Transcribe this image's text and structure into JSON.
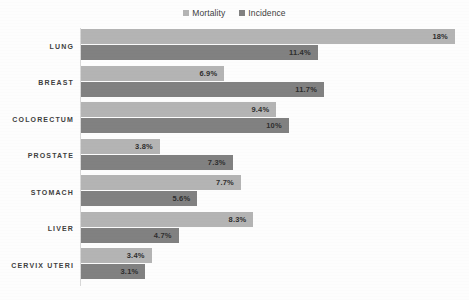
{
  "chart_data": {
    "type": "bar",
    "orientation": "horizontal",
    "grouped": true,
    "title": "",
    "subtitle": "",
    "xlabel": "",
    "ylabel": "",
    "grid": false,
    "legend_position": "top-center",
    "axis_tick_labels": [],
    "xlim": [
      0,
      18
    ],
    "categories": [
      "LUNG",
      "BREAST",
      "COLORECTUM",
      "PROSTATE",
      "STOMACH",
      "LIVER",
      "CERVIX UTERI"
    ],
    "series": [
      {
        "name": "Mortality",
        "color": "#b4b4b4",
        "values": [
          18,
          6.9,
          9.4,
          3.8,
          7.7,
          8.3,
          3.4
        ],
        "labels": [
          "18%",
          "6.9%",
          "9.4%",
          "3.8%",
          "7.7%",
          "8.3%",
          "3.4%"
        ]
      },
      {
        "name": "Incidence",
        "color": "#818181",
        "values": [
          11.4,
          11.7,
          10,
          7.3,
          5.6,
          4.7,
          3.1
        ],
        "labels": [
          "11.4%",
          "11.7%",
          "10%",
          "7.3%",
          "5.6%",
          "4.7%",
          "3.1%"
        ]
      }
    ]
  },
  "legend": {
    "items": [
      {
        "label": "Mortality",
        "color": "#b4b4b4",
        "icon": "square-swatch-icon"
      },
      {
        "label": "Incidence",
        "color": "#818181",
        "icon": "square-swatch-icon"
      }
    ]
  },
  "colors": {
    "mortality": "#b4b4b4",
    "incidence": "#818181",
    "axis": "#d8d8d8",
    "background": "#fdfdfd",
    "text": "#3f3f3f"
  }
}
